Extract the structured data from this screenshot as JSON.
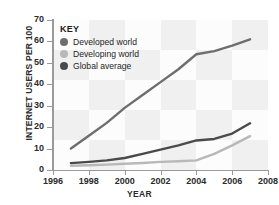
{
  "chart_data": {
    "type": "line",
    "title": "",
    "xlabel": "YEAR",
    "ylabel": "INTERNET USERS PER 100",
    "xlim": [
      1996,
      2008
    ],
    "ylim": [
      0,
      70
    ],
    "xticks": [
      "1996",
      "1998",
      "2000",
      "2002",
      "2004",
      "2006",
      "2008"
    ],
    "yticks": [
      "0",
      "10",
      "20",
      "30",
      "40",
      "50",
      "60",
      "70"
    ],
    "grid": "background-bands",
    "legend_position": "inside-top-left",
    "legend_title": "KEY",
    "x": [
      1997,
      1998,
      1999,
      2000,
      2001,
      2002,
      2003,
      2004,
      2005,
      2006,
      2007
    ],
    "series": [
      {
        "name": "Developed world",
        "color": "#6e6e6e",
        "values": [
          10,
          16,
          22,
          29,
          35,
          41,
          47,
          54,
          55.5,
          58,
          61
        ]
      },
      {
        "name": "Developing world",
        "color": "#b8b8b8",
        "values": [
          2,
          2.2,
          2.5,
          2.9,
          3.3,
          3.8,
          4.1,
          4.5,
          7.5,
          11.5,
          15.8
        ]
      },
      {
        "name": "Global average",
        "color": "#4a4a4a",
        "values": [
          3.2,
          3.8,
          4.5,
          5.6,
          7.5,
          9.5,
          11.5,
          13.8,
          14.5,
          17,
          21.8
        ]
      }
    ]
  },
  "axis": {
    "ylabel_text": "INTERNET USERS PER 100",
    "xlabel_text": "YEAR"
  },
  "legend": {
    "title": "KEY",
    "items": [
      {
        "label": "Developed world",
        "color": "#6e6e6e"
      },
      {
        "label": "Developing world",
        "color": "#b8b8b8"
      },
      {
        "label": "Global average",
        "color": "#4a4a4a"
      }
    ]
  }
}
